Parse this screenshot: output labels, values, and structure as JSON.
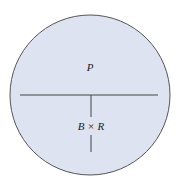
{
  "diagram": {
    "type": "circle-partition",
    "colors": {
      "fill": "#dde3f1",
      "stroke": "#555555",
      "text": "#222222"
    },
    "regions": {
      "top": {
        "label": "P"
      },
      "bottom": {
        "label": "B × R"
      }
    }
  }
}
